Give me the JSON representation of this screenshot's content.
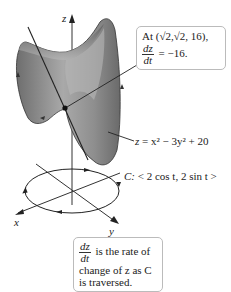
{
  "figure": {
    "axes": {
      "x_label": "x",
      "y_label": "y",
      "z_label": "z"
    },
    "surface": {
      "equation_lhs": "z",
      "equation_rhs": "= x² − 3y² + 20",
      "fill_color": "#8a8a8a"
    },
    "curve": {
      "name": "C",
      "label_prefix": "C:",
      "label_param": "< 2 cos t, 2 sin t >"
    },
    "point_callout": {
      "line1": "At (√2,√2, 16),",
      "deriv_num": "dz",
      "deriv_den": "dt",
      "deriv_value": "= −16."
    },
    "explanation_callout": {
      "deriv_num": "dz",
      "deriv_den": "dt",
      "line1_rest": "is the rate of",
      "line2": "change of z as C",
      "line3": "is traversed."
    }
  }
}
